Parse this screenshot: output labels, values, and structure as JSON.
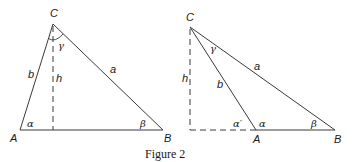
{
  "caption": "Figure 2",
  "colors": {
    "stroke": "#3a3a3a",
    "text": "#1a1a1a",
    "background": "#ffffff"
  },
  "left_triangle": {
    "vertices": {
      "A": "A",
      "B": "B",
      "C": "C"
    },
    "sides": {
      "a": "a",
      "b": "b"
    },
    "altitude": "h",
    "angles": {
      "alpha": "α",
      "beta": "β",
      "gamma": "γ"
    }
  },
  "right_triangle": {
    "vertices": {
      "A": "A",
      "B": "B",
      "C": "C"
    },
    "sides": {
      "a": "a",
      "b": "b"
    },
    "altitude": "h",
    "angles": {
      "alpha": "α",
      "alpha_prime": "α′",
      "beta": "β",
      "gamma": "γ"
    }
  }
}
